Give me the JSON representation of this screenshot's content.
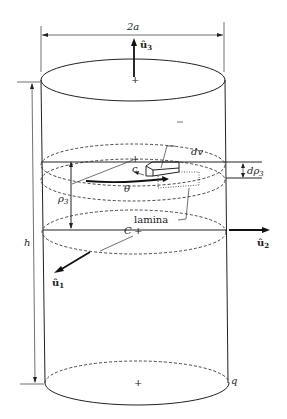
{
  "figure": {
    "type": "cylinder-volume-element-diagram",
    "labels": {
      "diameter": "2a",
      "height": "h",
      "unit_vector_3": "û",
      "unit_vector_3_sub": "3",
      "unit_vector_2": "û",
      "unit_vector_2_sub": "2",
      "unit_vector_1": "û",
      "unit_vector_1_sub": "1",
      "volume_element": "dv",
      "thickness": "dρ",
      "thickness_sub": "3",
      "position": "ρ",
      "position_sub": "3",
      "angle": "θ",
      "lamina_center": "c",
      "cylinder_center": "C",
      "lamina": "lamina",
      "point": "q"
    }
  }
}
